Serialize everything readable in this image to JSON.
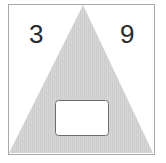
{
  "diagram": {
    "shape": "triangle",
    "left_number": "3",
    "right_number": "9",
    "center_box_value": "",
    "colors": {
      "triangle_fill": "#d4d4d4",
      "frame_border": "#a8a8a8",
      "box_border": "#6e6e6e",
      "text": "#2a2a2a"
    }
  }
}
